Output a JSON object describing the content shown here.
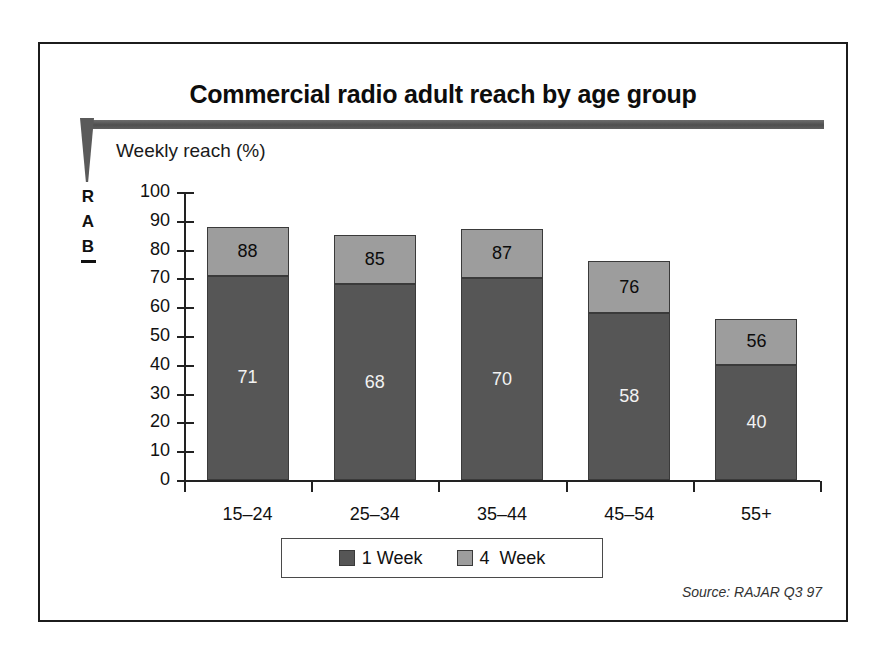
{
  "slide": {
    "title": "Commercial radio adult reach by age group",
    "axis_title": "Weekly reach (%)",
    "source": "Source: RAJAR Q3 97",
    "logo": {
      "name": "RAB",
      "letters": [
        "R",
        "A",
        "B"
      ]
    }
  },
  "colors": {
    "series_1_week": "#565656",
    "series_4_week": "#9d9d9d",
    "frame": "#1c1c1c",
    "rule": "#5a5a5a",
    "axis": "#222222"
  },
  "chart_data": {
    "type": "bar",
    "stacked": true,
    "title": "Commercial radio adult reach by age group",
    "subtitle": "",
    "xlabel": "",
    "ylabel": "Weekly reach (%)",
    "ylim": [
      0,
      100
    ],
    "ytick_labels": [
      "100",
      "90",
      "80",
      "70",
      "60",
      "50",
      "40",
      "30",
      "20",
      "10",
      "0"
    ],
    "ytick_values": [
      100,
      90,
      80,
      70,
      60,
      50,
      40,
      30,
      20,
      10,
      0
    ],
    "grid": false,
    "legend_position": "bottom",
    "categories": [
      "15–24",
      "25–34",
      "35–44",
      "45–54",
      "55+"
    ],
    "series": [
      {
        "name": "1 Week",
        "values": [
          71,
          68,
          70,
          58,
          40
        ]
      },
      {
        "name": "4  Week",
        "values": [
          88,
          85,
          87,
          76,
          56
        ]
      }
    ],
    "bar_labels": {
      "bottom": [
        "71",
        "68",
        "70",
        "58",
        "40"
      ],
      "top": [
        "88",
        "85",
        "87",
        "76",
        "56"
      ]
    },
    "annotations": [
      "Source: RAJAR Q3 97"
    ]
  },
  "legend": {
    "items": [
      {
        "label": "1 Week",
        "color": "#565656"
      },
      {
        "label": "4  Week",
        "color": "#9d9d9d"
      }
    ]
  }
}
